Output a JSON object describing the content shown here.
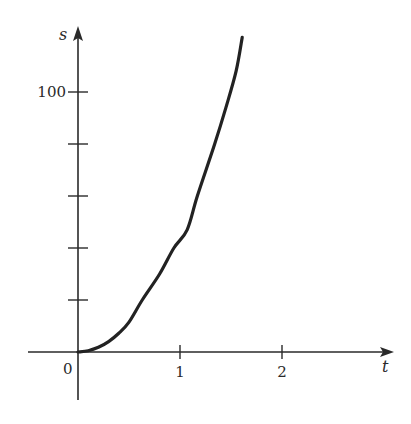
{
  "chart_data": {
    "type": "line",
    "title": "",
    "xlabel": "t",
    "ylabel": "s",
    "x_ticks": [
      1,
      2
    ],
    "x_tick_labels": [
      "1",
      "2"
    ],
    "y_ticks": [
      20,
      40,
      60,
      80,
      100
    ],
    "y_tick_labels": [
      "",
      "",
      "",
      "",
      "100"
    ],
    "origin_label": "0",
    "xlim": [
      -0.45,
      3.1
    ],
    "ylim": [
      -28,
      125
    ],
    "grid": false,
    "legend": null,
    "series": [
      {
        "name": "s(t)",
        "x": [
          0,
          0.1,
          0.2,
          0.3,
          0.4,
          0.5,
          0.63,
          0.8,
          0.94,
          1.07,
          1.17,
          1.34,
          1.45,
          1.55,
          1.61
        ],
        "y": [
          0,
          0.5,
          1.8,
          4,
          7.2,
          11.5,
          20,
          30,
          40,
          47,
          60,
          80,
          94,
          108,
          121
        ]
      }
    ]
  }
}
